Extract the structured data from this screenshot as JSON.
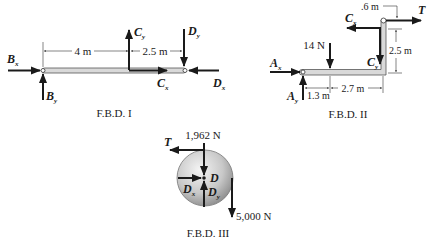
{
  "fbd1": {
    "caption": "F.B.D. I",
    "forces": {
      "Bx": {
        "main": "B",
        "sub": "x"
      },
      "By": {
        "main": "B",
        "sub": "y"
      },
      "Cy": {
        "main": "C",
        "sub": "y"
      },
      "Cx": {
        "main": "C",
        "sub": "x"
      },
      "Dy": {
        "main": "D",
        "sub": "y"
      },
      "Dx": {
        "main": "D",
        "sub": "x"
      }
    },
    "dimensions": {
      "d1": "4 m",
      "d2": "2.5 m"
    }
  },
  "fbd2": {
    "caption": "F.B.D. II",
    "forces": {
      "Ax": {
        "main": "A",
        "sub": "x"
      },
      "Ay": {
        "main": "A",
        "sub": "y"
      },
      "Cx": {
        "main": "C",
        "sub": "x"
      },
      "Cy": {
        "main": "C",
        "sub": "y"
      },
      "T": {
        "main": "T"
      },
      "load": "14 N"
    },
    "dimensions": {
      "d1": "1.3 m",
      "d2": "2.7 m",
      "d3": "2.5 m",
      "d4": ".6 m"
    }
  },
  "fbd3": {
    "caption": "F.B.D. III",
    "center_label": "D",
    "forces": {
      "T": {
        "main": "T"
      },
      "Dx": {
        "main": "D",
        "sub": "x"
      },
      "Dy": {
        "main": "D",
        "sub": "y"
      },
      "top_load": "1,962 N",
      "hang_load": "5,000 N"
    }
  },
  "colors": {
    "member_fill": "#d9d9d9",
    "member_stroke": "#555555",
    "arrow": "#1a1a1a",
    "pulley_light": "#f2f2f2",
    "pulley_dark": "#8a8a8a"
  }
}
